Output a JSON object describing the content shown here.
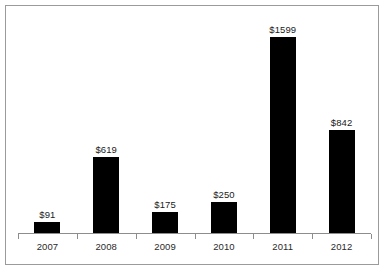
{
  "chart_data": {
    "type": "bar",
    "title": "",
    "subtitle": "",
    "xlabel": "",
    "ylabel": "",
    "categories": [
      "2007",
      "2008",
      "2009",
      "2010",
      "2011",
      "2012"
    ],
    "values": [
      91,
      619,
      175,
      250,
      1599,
      842
    ],
    "data_labels": [
      "$91",
      "$619",
      "$175",
      "$250",
      "$1599",
      "$842"
    ],
    "series": [
      {
        "name": "",
        "values": [
          91,
          619,
          175,
          250,
          1599,
          842
        ]
      }
    ],
    "ylim": [
      0,
      1850
    ],
    "grid": false,
    "legend": false,
    "legend_position": "none",
    "axis": {
      "x_axis_visible": true,
      "y_axis_visible": false,
      "x_tick_marks": true,
      "y_tick_labels": []
    },
    "colors": {
      "bar": "#000000",
      "axis": "#8d8d8d",
      "frame": "#9b9b9b",
      "background": "#ffffff",
      "label_text": "#1a1a1a"
    }
  }
}
